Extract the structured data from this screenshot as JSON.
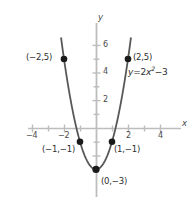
{
  "chart_data": {
    "type": "line",
    "title": "",
    "equation_label": "y = 2x² −3",
    "equation_parts": {
      "lhs": "y",
      "eq": "=",
      "coef": "2",
      "var": "x",
      "exp": "2",
      "minus": "−",
      "constant": "3"
    },
    "function": "y = 2x^2 - 3",
    "xlabel": "x",
    "ylabel": "y",
    "xlim": [
      -5.2,
      5.2
    ],
    "ylim": [
      -4.8,
      7.2
    ],
    "x_ticks": [
      -4,
      -2,
      2,
      4
    ],
    "x_tick_labels": [
      "−4",
      "−2",
      "2",
      "4"
    ],
    "y_ticks": [
      2,
      4,
      6
    ],
    "y_tick_labels": [
      "2",
      "4",
      "6"
    ],
    "grid": false,
    "legend": "none",
    "curve_domain": [
      -2.18,
      2.18
    ],
    "points": [
      {
        "name": "point-neg2-5",
        "x": -2,
        "y": 5,
        "label": "(−2,5)",
        "label_side": "left"
      },
      {
        "name": "point-neg1-neg1",
        "x": -1,
        "y": -1,
        "label": "(−1,−1)",
        "label_side": "below-left"
      },
      {
        "name": "point-0-neg3",
        "x": 0,
        "y": -3,
        "label": "(0,−3)",
        "label_side": "right"
      },
      {
        "name": "point-1-neg1",
        "x": 1,
        "y": -1,
        "label": "(1,−1)",
        "label_side": "below-right"
      },
      {
        "name": "point-2-5",
        "x": 2,
        "y": 5,
        "label": "(2,5)",
        "label_side": "right"
      }
    ],
    "colors": {
      "background": "#ffffff",
      "axis": "#bdbdbd",
      "curve": "#585858",
      "point": "#1a1a1a",
      "text": "#333333"
    }
  },
  "labels": {
    "y_axis_name": "y",
    "x_axis_name": "x",
    "tick_x_neg4": "−4",
    "tick_x_neg2": "−2",
    "tick_x_2": "2",
    "tick_x_4": "4",
    "tick_y_2": "2",
    "tick_y_4": "4",
    "tick_y_6": "6",
    "pt_neg2_5": "(−2,5)",
    "pt_2_5": "(2,5)",
    "pt_neg1_neg1": "(−1,−1)",
    "pt_1_neg1": "(1,−1)",
    "pt_0_neg3": "(0,−3)",
    "eq_lhs": "y",
    "eq_sign": "=",
    "eq_coef": "2",
    "eq_var": "x",
    "eq_exp": "2",
    "eq_minus": "−3"
  }
}
